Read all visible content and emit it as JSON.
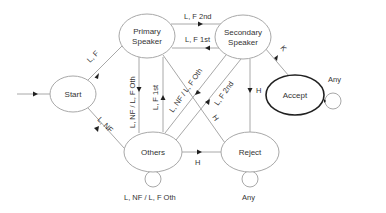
{
  "diagram": {
    "type": "state-machine",
    "states": {
      "start": {
        "label": "Start"
      },
      "primary": {
        "label_line1": "Primary",
        "label_line2": "Speaker"
      },
      "secondary": {
        "label_line1": "Secondary",
        "label_line2": "Speaker"
      },
      "accept": {
        "label": "Accept"
      },
      "others": {
        "label": "Others"
      },
      "reject": {
        "label": "Reject"
      }
    },
    "transitions": {
      "start_to_primary": "L, F",
      "start_to_others": "L, NF",
      "primary_to_secondary": "L, F 2nd",
      "secondary_to_primary": "L, F 1st",
      "primary_to_others": "L, NF / L, F Oth",
      "others_to_primary": "L, F 1st",
      "primary_to_reject": "H",
      "secondary_to_others": "L, NF / L, F Oth",
      "others_to_secondary": "L, F 2nd",
      "secondary_to_reject": "H",
      "secondary_to_accept": "K",
      "others_to_reject": "H",
      "others_self": "L, NF / L, F Oth",
      "reject_self": "Any",
      "accept_self": "Any"
    }
  }
}
